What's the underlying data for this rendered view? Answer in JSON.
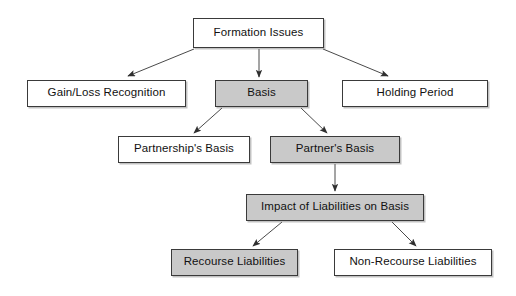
{
  "diagram": {
    "title": "Formation Issues",
    "type": "hierarchy-flowchart",
    "canvas": {
      "width": 516,
      "height": 296,
      "background": "#ffffff"
    },
    "colors": {
      "shaded_fill": "#c9c9c9",
      "plain_fill": "#ffffff",
      "border": "#3a3a3a",
      "arrow": "#4a4a4a",
      "text": "#111111"
    },
    "nodes": [
      {
        "id": "formation-issues",
        "label": "Formation Issues",
        "shaded": false,
        "x": 193,
        "y": 18,
        "w": 131,
        "h": 30
      },
      {
        "id": "gain-loss-recognition",
        "label": "Gain/Loss Recognition",
        "shaded": false,
        "x": 27,
        "y": 80,
        "w": 159,
        "h": 27
      },
      {
        "id": "basis",
        "label": "Basis",
        "shaded": true,
        "x": 215,
        "y": 80,
        "w": 93,
        "h": 27
      },
      {
        "id": "holding-period",
        "label": "Holding Period",
        "shaded": false,
        "x": 342,
        "y": 80,
        "w": 146,
        "h": 27
      },
      {
        "id": "partnerships-basis",
        "label": "Partnership's Basis",
        "shaded": false,
        "x": 118,
        "y": 136,
        "w": 132,
        "h": 27
      },
      {
        "id": "partners-basis",
        "label": "Partner's Basis",
        "shaded": true,
        "x": 270,
        "y": 136,
        "w": 130,
        "h": 27
      },
      {
        "id": "impact-of-liabilities-on-basis",
        "label": "Impact of Liabilities on Basis",
        "shaded": true,
        "x": 246,
        "y": 194,
        "w": 178,
        "h": 27
      },
      {
        "id": "recourse-liabilities",
        "label": "Recourse Liabilities",
        "shaded": true,
        "x": 171,
        "y": 249,
        "w": 127,
        "h": 27
      },
      {
        "id": "non-recourse-liabilities",
        "label": "Non-Recourse Liabilities",
        "shaded": false,
        "x": 334,
        "y": 249,
        "w": 158,
        "h": 27
      }
    ],
    "edges": [
      {
        "id": "formation-to-gain-loss",
        "from": "formation-issues",
        "to": "gain-loss-recognition",
        "x1": 194,
        "y1": 49,
        "x2": 128,
        "y2": 76
      },
      {
        "id": "formation-to-basis",
        "from": "formation-issues",
        "to": "basis",
        "x1": 259,
        "y1": 49,
        "x2": 259,
        "y2": 77
      },
      {
        "id": "formation-to-holding-period",
        "from": "formation-issues",
        "to": "holding-period",
        "x1": 323,
        "y1": 49,
        "x2": 388,
        "y2": 76
      },
      {
        "id": "basis-to-partnerships-basis",
        "from": "basis",
        "to": "partnerships-basis",
        "x1": 222,
        "y1": 108,
        "x2": 194,
        "y2": 133
      },
      {
        "id": "basis-to-partners-basis",
        "from": "basis",
        "to": "partners-basis",
        "x1": 301,
        "y1": 108,
        "x2": 327,
        "y2": 133
      },
      {
        "id": "partners-basis-to-impact",
        "from": "partners-basis",
        "to": "impact-of-liabilities-on-basis",
        "x1": 335,
        "y1": 164,
        "x2": 335,
        "y2": 191
      },
      {
        "id": "impact-to-recourse",
        "from": "impact-of-liabilities-on-basis",
        "to": "recourse-liabilities",
        "x1": 282,
        "y1": 222,
        "x2": 253,
        "y2": 246
      },
      {
        "id": "impact-to-non-recourse",
        "from": "impact-of-liabilities-on-basis",
        "to": "non-recourse-liabilities",
        "x1": 392,
        "y1": 222,
        "x2": 416,
        "y2": 246
      }
    ]
  }
}
